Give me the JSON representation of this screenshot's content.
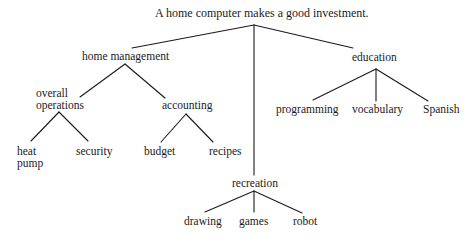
{
  "diagram": {
    "type": "tree",
    "root": {
      "id": "root",
      "label": "A home computer makes a good investment.",
      "x": 155,
      "y": 7,
      "anchor": [
        254,
        25
      ]
    },
    "nodes": [
      {
        "id": "home_management",
        "lines": [
          "home management"
        ],
        "x": 82,
        "y": 50,
        "anchor": [
          125,
          64
        ],
        "parent": "root"
      },
      {
        "id": "overall_operations",
        "lines": [
          "overall",
          "operations"
        ],
        "x": 36,
        "y": 87,
        "anchor": [
          59,
          112
        ],
        "parent": "home_management"
      },
      {
        "id": "heat_pump",
        "lines": [
          "heat",
          "pump"
        ],
        "x": 17,
        "y": 145,
        "parent": "overall_operations"
      },
      {
        "id": "security",
        "lines": [
          "security"
        ],
        "x": 76,
        "y": 145,
        "parent": "overall_operations"
      },
      {
        "id": "accounting",
        "lines": [
          "accounting"
        ],
        "x": 162,
        "y": 99,
        "anchor": [
          186,
          114
        ],
        "parent": "home_management"
      },
      {
        "id": "budget",
        "lines": [
          "budget"
        ],
        "x": 144,
        "y": 145,
        "parent": "accounting"
      },
      {
        "id": "recipes",
        "lines": [
          "recipes"
        ],
        "x": 209,
        "y": 145,
        "parent": "accounting"
      },
      {
        "id": "recreation",
        "lines": [
          "recreation"
        ],
        "x": 232,
        "y": 177,
        "anchor": [
          254,
          191
        ],
        "parent": "root"
      },
      {
        "id": "drawing",
        "lines": [
          "drawing"
        ],
        "x": 184,
        "y": 215,
        "parent": "recreation"
      },
      {
        "id": "games",
        "lines": [
          "games"
        ],
        "x": 239,
        "y": 215,
        "parent": "recreation"
      },
      {
        "id": "robot",
        "lines": [
          "robot"
        ],
        "x": 293,
        "y": 215,
        "parent": "recreation"
      },
      {
        "id": "education",
        "lines": [
          "education"
        ],
        "x": 352,
        "y": 51,
        "anchor": [
          376,
          69
        ],
        "parent": "root"
      },
      {
        "id": "programming",
        "lines": [
          "programming"
        ],
        "x": 276,
        "y": 103,
        "parent": "education"
      },
      {
        "id": "vocabulary",
        "lines": [
          "vocabulary"
        ],
        "x": 352,
        "y": 103,
        "parent": "education"
      },
      {
        "id": "spanish",
        "lines": [
          "Spanish"
        ],
        "x": 423,
        "y": 103,
        "parent": "education"
      }
    ],
    "edges": [
      {
        "from": "root",
        "to": "home_management",
        "x1": 254,
        "y1": 25,
        "x2": 132,
        "y2": 48
      },
      {
        "from": "root",
        "to": "recreation",
        "x1": 254,
        "y1": 25,
        "x2": 254,
        "y2": 175
      },
      {
        "from": "root",
        "to": "education",
        "x1": 254,
        "y1": 25,
        "x2": 353,
        "y2": 48
      },
      {
        "from": "home_management",
        "to": "overall_operations",
        "x1": 125,
        "y1": 64,
        "x2": 80,
        "y2": 97
      },
      {
        "from": "home_management",
        "to": "accounting",
        "x1": 125,
        "y1": 64,
        "x2": 165,
        "y2": 98
      },
      {
        "from": "overall_operations",
        "to": "heat_pump",
        "x1": 59,
        "y1": 112,
        "x2": 31,
        "y2": 141
      },
      {
        "from": "overall_operations",
        "to": "security",
        "x1": 59,
        "y1": 112,
        "x2": 88,
        "y2": 141
      },
      {
        "from": "accounting",
        "to": "budget",
        "x1": 186,
        "y1": 114,
        "x2": 161,
        "y2": 142
      },
      {
        "from": "accounting",
        "to": "recipes",
        "x1": 186,
        "y1": 114,
        "x2": 213,
        "y2": 142
      },
      {
        "from": "recreation",
        "to": "drawing",
        "x1": 254,
        "y1": 191,
        "x2": 205,
        "y2": 212
      },
      {
        "from": "recreation",
        "to": "games",
        "x1": 254,
        "y1": 191,
        "x2": 254,
        "y2": 212
      },
      {
        "from": "recreation",
        "to": "robot",
        "x1": 254,
        "y1": 191,
        "x2": 302,
        "y2": 213
      },
      {
        "from": "education",
        "to": "programming",
        "x1": 376,
        "y1": 69,
        "x2": 313,
        "y2": 100
      },
      {
        "from": "education",
        "to": "vocabulary",
        "x1": 376,
        "y1": 69,
        "x2": 376,
        "y2": 101
      },
      {
        "from": "education",
        "to": "spanish",
        "x1": 376,
        "y1": 69,
        "x2": 428,
        "y2": 101
      }
    ]
  }
}
